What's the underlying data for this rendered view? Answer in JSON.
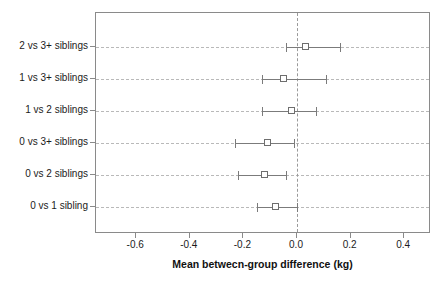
{
  "chart_data": {
    "type": "scatter",
    "subtype": "forest-plot",
    "title": "",
    "xlabel": "Mean betwecn-group difference (kg)",
    "ylabel": "",
    "xlim": [
      -0.75,
      0.5
    ],
    "xticks": [
      -0.6,
      -0.4,
      -0.2,
      0.0,
      0.2,
      0.4
    ],
    "xticklabels": [
      "-0.6",
      "-0.4",
      "-0.2",
      "0.0",
      "0.2",
      "0.4"
    ],
    "grid": true,
    "grid_style": "dashed-horizontal-per-row",
    "legend": "none",
    "reference_line": {
      "value": 0.0,
      "orientation": "vertical",
      "style": "dashed",
      "color": "#9a9a9a"
    },
    "marker": "open-square",
    "error_bar_type": "95% confidence interval",
    "categories": [
      "2 vs 3+ siblings",
      "1 vs 3+ siblings",
      "1 vs 2 siblings",
      "0 vs 3+ siblings",
      "0 vs 2 siblings",
      "0 vs 1 sibling"
    ],
    "values": [
      0.03,
      -0.05,
      -0.02,
      -0.11,
      -0.12,
      -0.08
    ],
    "ci_low": [
      -0.04,
      -0.13,
      -0.13,
      -0.23,
      -0.22,
      -0.15
    ],
    "ci_high": [
      0.16,
      0.11,
      0.07,
      -0.01,
      -0.04,
      0.0
    ],
    "points": [
      {
        "label": "2 vs 3+ siblings",
        "estimate": 0.03,
        "ci_low": -0.04,
        "ci_high": 0.16
      },
      {
        "label": "1 vs 3+ siblings",
        "estimate": -0.05,
        "ci_low": -0.13,
        "ci_high": 0.11
      },
      {
        "label": "1 vs 2 siblings",
        "estimate": -0.02,
        "ci_low": -0.13,
        "ci_high": 0.07
      },
      {
        "label": "0 vs 3+ siblings",
        "estimate": -0.11,
        "ci_low": -0.23,
        "ci_high": -0.01
      },
      {
        "label": "0 vs 2 siblings",
        "estimate": -0.12,
        "ci_low": -0.22,
        "ci_high": -0.04
      },
      {
        "label": "0 vs 1 sibling",
        "estimate": -0.08,
        "ci_low": -0.15,
        "ci_high": 0.0
      }
    ],
    "colors": {
      "marker": "#6e6e6e",
      "errorbar": "#7b7b7b",
      "gridline": "#b9b9b9",
      "reference_line": "#9a9a9a",
      "axis": "#8a8a8a",
      "text": "#1b1b1b",
      "background": "#ffffff"
    }
  }
}
